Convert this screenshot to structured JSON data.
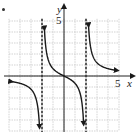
{
  "chart_data": {
    "type": "line",
    "title": "",
    "xlabel": "x",
    "ylabel": "y",
    "x_tick_label": "5",
    "y_tick_label": "5",
    "xlim": [
      -5.2,
      5.2
    ],
    "ylim": [
      -5,
      5.2
    ],
    "grid": true,
    "grid_spacing": 1,
    "vertical_asymptotes": [
      -2,
      2
    ],
    "function": "y = 2x / (x^2 - 4)",
    "series": [
      {
        "name": "left-branch",
        "x": [
          -4.8,
          -4,
          -3,
          -2.5,
          -2.2,
          -2.1
        ],
        "y": [
          -0.5,
          -0.67,
          -1.2,
          -2.2,
          -5.0,
          -5.0
        ]
      },
      {
        "name": "middle-branch",
        "x": [
          -1.75,
          -1.5,
          -1,
          -0.5,
          0,
          0.5,
          1,
          1.5,
          1.75
        ],
        "y": [
          4.7,
          1.7,
          0.67,
          0.27,
          0,
          -0.27,
          -0.67,
          -1.7,
          -4.7
        ]
      },
      {
        "name": "right-branch",
        "x": [
          2.1,
          2.2,
          2.5,
          3,
          4,
          4.8
        ],
        "y": [
          5.0,
          5.0,
          2.2,
          1.2,
          0.67,
          0.5
        ]
      }
    ],
    "colors": {
      "curve": "#1a1a1a",
      "grid": "#c8c8c8",
      "axis": "#222222",
      "asymptote": "#333333"
    }
  },
  "labels": {
    "x_axis": "x",
    "y_axis": "y",
    "x_five": "5",
    "y_five": "5"
  }
}
